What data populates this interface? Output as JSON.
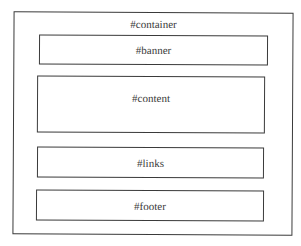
{
  "diagram": {
    "container": {
      "label": "#container"
    },
    "banner": {
      "label": "#banner"
    },
    "content": {
      "label": "#content"
    },
    "links": {
      "label": "#links"
    },
    "footer": {
      "label": "#footer"
    }
  },
  "colors": {
    "stroke": "#3a3a3a",
    "background": "#ffffff"
  }
}
